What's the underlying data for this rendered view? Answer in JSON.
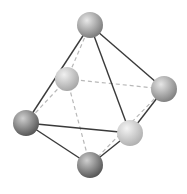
{
  "diagram": {
    "width": 187,
    "height": 194,
    "colors": {
      "background": "#ffffff",
      "solid_edge": "#3a3a3a",
      "dashed_edge": "#b8b8b8"
    },
    "nodes": [
      {
        "id": "top",
        "x": 90,
        "y": 25,
        "r": 13,
        "light": "#e8e8e8",
        "dark": "#7a7a7a"
      },
      {
        "id": "back-left",
        "x": 67,
        "y": 79,
        "r": 12,
        "light": "#f0f0f0",
        "dark": "#a6a6a6"
      },
      {
        "id": "right",
        "x": 164,
        "y": 89,
        "r": 13,
        "light": "#e6e6e6",
        "dark": "#808080"
      },
      {
        "id": "left",
        "x": 26,
        "y": 123,
        "r": 13,
        "light": "#cfcfcf",
        "dark": "#555555"
      },
      {
        "id": "front",
        "x": 130,
        "y": 133,
        "r": 13,
        "light": "#f4f4f4",
        "dark": "#b0b0b0"
      },
      {
        "id": "bottom",
        "x": 90,
        "y": 165,
        "r": 13,
        "light": "#cfcfcf",
        "dark": "#555555"
      }
    ],
    "edges": [
      {
        "from": "top",
        "to": "back-left",
        "style": "dashed"
      },
      {
        "from": "left",
        "to": "back-left",
        "style": "dashed"
      },
      {
        "from": "back-left",
        "to": "right",
        "style": "dashed"
      },
      {
        "from": "back-left",
        "to": "bottom",
        "style": "dashed"
      },
      {
        "from": "right",
        "to": "bottom",
        "style": "dashed"
      },
      {
        "from": "top",
        "to": "left",
        "style": "solid"
      },
      {
        "from": "top",
        "to": "right",
        "style": "solid"
      },
      {
        "from": "top",
        "to": "front",
        "style": "solid"
      },
      {
        "from": "left",
        "to": "front",
        "style": "solid"
      },
      {
        "from": "left",
        "to": "bottom",
        "style": "solid"
      },
      {
        "from": "front",
        "to": "bottom",
        "style": "solid"
      },
      {
        "from": "right",
        "to": "front",
        "style": "solid"
      }
    ]
  }
}
